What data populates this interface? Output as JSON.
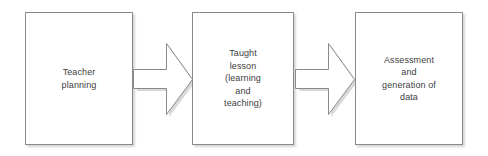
{
  "diagram": {
    "type": "process-flow",
    "orientation": "horizontal",
    "background_color": "#ffffff",
    "box_border_color": "#8a8a8a",
    "box_fill_color": "#ffffff",
    "text_color": "#404040",
    "arrow_outline_color": "#8a8a8a",
    "arrow_fill_color": "#ffffff",
    "nodes": [
      {
        "id": "teacher-planning",
        "label": "Teacher\nplanning",
        "x": 25,
        "y": 12,
        "width": 108,
        "height": 133
      },
      {
        "id": "taught-lesson",
        "label": "Taught\nlesson\n(learning\nand\nteaching)",
        "x": 192,
        "y": 12,
        "width": 102,
        "height": 133
      },
      {
        "id": "assessment-generation-of-data",
        "label": "Assessment\nand\ngeneration of\ndata",
        "x": 355,
        "y": 12,
        "width": 108,
        "height": 133
      }
    ],
    "connectors": [
      {
        "id": "arrow-planning-to-lesson",
        "from": "teacher-planning",
        "to": "taught-lesson",
        "direction": "right",
        "x": 133,
        "y": 42,
        "width": 60,
        "height": 74
      },
      {
        "id": "arrow-lesson-to-assessment",
        "from": "taught-lesson",
        "to": "assessment-generation-of-data",
        "direction": "right",
        "x": 295,
        "y": 42,
        "width": 60,
        "height": 74
      }
    ]
  }
}
